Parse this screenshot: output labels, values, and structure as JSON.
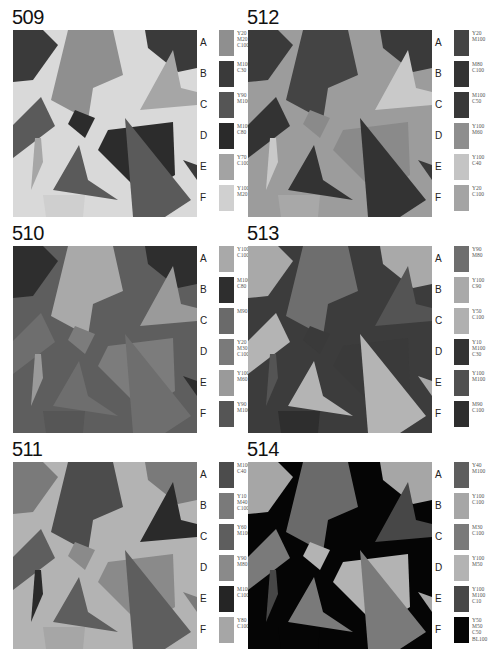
{
  "panels": [
    {
      "id": "509",
      "background": "#d9d9d9",
      "fills": [
        "#8f8f8f",
        "#3a3a3a",
        "#5a5a5a",
        "#2c2c2c",
        "#a6a6a6",
        "#cfcfcf"
      ],
      "swatches": [
        {
          "letter": "A",
          "color": "#8f8f8f",
          "codes": "Y20\nM20\nC100"
        },
        {
          "letter": "B",
          "color": "#3a3a3a",
          "codes": "M100\nC30"
        },
        {
          "letter": "C",
          "color": "#555555",
          "codes": "Y90\nM100"
        },
        {
          "letter": "D",
          "color": "#2a2a2a",
          "codes": "M100\nC80"
        },
        {
          "letter": "E",
          "color": "#a3a3a3",
          "codes": "Y70\nC100"
        },
        {
          "letter": "F",
          "color": "#d0d0d0",
          "codes": "Y100\nM20"
        }
      ]
    },
    {
      "id": "512",
      "background": "#9c9c9c",
      "fills": [
        "#444444",
        "#3a3a3a",
        "#333333",
        "#8a8a8a",
        "#c9c9c9",
        "#a8a8a8"
      ],
      "swatches": [
        {
          "letter": "A",
          "color": "#444444",
          "codes": "Y20\nM100"
        },
        {
          "letter": "B",
          "color": "#333333",
          "codes": "M80\nC100"
        },
        {
          "letter": "C",
          "color": "#383838",
          "codes": "M100\nC50"
        },
        {
          "letter": "D",
          "color": "#8e8e8e",
          "codes": "Y100\nM60"
        },
        {
          "letter": "E",
          "color": "#c4c4c4",
          "codes": "Y100\nC40"
        },
        {
          "letter": "F",
          "color": "#a4a4a4",
          "codes": "Y20\nC100"
        }
      ]
    },
    {
      "id": "510",
      "background": "#5e5e5e",
      "fills": [
        "#a9a9a9",
        "#2e2e2e",
        "#6e6e6e",
        "#7c7c7c",
        "#9a9a9a",
        "#565656"
      ],
      "swatches": [
        {
          "letter": "A",
          "color": "#a9a9a9",
          "codes": "Y100\nC100"
        },
        {
          "letter": "B",
          "color": "#2e2e2e",
          "codes": "M100\nC80"
        },
        {
          "letter": "C",
          "color": "#6a6a6a",
          "codes": "M90"
        },
        {
          "letter": "D",
          "color": "#7a7a7a",
          "codes": "Y20\nM30\nC100"
        },
        {
          "letter": "E",
          "color": "#9a9a9a",
          "codes": "Y100\nM60"
        },
        {
          "letter": "F",
          "color": "#555555",
          "codes": "Y90\nM100"
        }
      ]
    },
    {
      "id": "513",
      "background": "#3c3c3c",
      "fills": [
        "#6e6e6e",
        "#a9a9a9",
        "#b4b4b4",
        "#3a3a3a",
        "#545454",
        "#2e2e2e"
      ],
      "swatches": [
        {
          "letter": "A",
          "color": "#6e6e6e",
          "codes": "Y90\nM80"
        },
        {
          "letter": "B",
          "color": "#a9a9a9",
          "codes": "Y100\nC90"
        },
        {
          "letter": "C",
          "color": "#b0b0b0",
          "codes": "Y50\nC100"
        },
        {
          "letter": "D",
          "color": "#333333",
          "codes": "Y10\nM100\nC30"
        },
        {
          "letter": "E",
          "color": "#505050",
          "codes": "Y100\nM100"
        },
        {
          "letter": "F",
          "color": "#2e2e2e",
          "codes": "M90\nC100"
        }
      ]
    },
    {
      "id": "511",
      "background": "#b3b3b3",
      "fills": [
        "#4c4c4c",
        "#7a7a7a",
        "#5e5e5e",
        "#8a8a8a",
        "#2a2a2a",
        "#a6a6a6"
      ],
      "swatches": [
        {
          "letter": "A",
          "color": "#4c4c4c",
          "codes": "M100\nC40"
        },
        {
          "letter": "B",
          "color": "#7a7a7a",
          "codes": "Y10\nM40\nC100"
        },
        {
          "letter": "C",
          "color": "#5e5e5e",
          "codes": "Y60\nM100"
        },
        {
          "letter": "D",
          "color": "#8a8a8a",
          "codes": "Y90\nM80"
        },
        {
          "letter": "E",
          "color": "#252525",
          "codes": "M100\nC100"
        },
        {
          "letter": "F",
          "color": "#a6a6a6",
          "codes": "Y80\nC100"
        }
      ]
    },
    {
      "id": "514",
      "background": "#050505",
      "fills": [
        "#6a6a6a",
        "#a6a6a6",
        "#7a7a7a",
        "#b3b3b3",
        "#474747",
        "#050505"
      ],
      "swatches": [
        {
          "letter": "A",
          "color": "#5e5e5e",
          "codes": "Y40\nM100"
        },
        {
          "letter": "B",
          "color": "#a6a6a6",
          "codes": "Y100\nC100"
        },
        {
          "letter": "C",
          "color": "#7a7a7a",
          "codes": "M30\nC100"
        },
        {
          "letter": "D",
          "color": "#b3b3b3",
          "codes": "Y100\nM50"
        },
        {
          "letter": "E",
          "color": "#474747",
          "codes": "Y100\nM100\nC10"
        },
        {
          "letter": "F",
          "color": "#050505",
          "codes": "Y50\nM50\nC50\nBL100"
        }
      ]
    }
  ]
}
